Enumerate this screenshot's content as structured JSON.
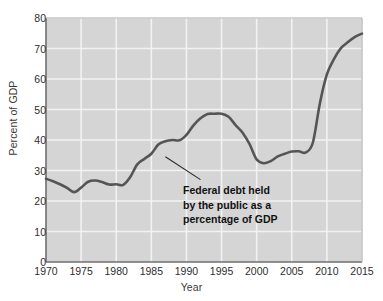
{
  "chart_data": {
    "type": "line",
    "title": "",
    "xlabel": "Year",
    "ylabel": "Percent of GDP",
    "xlim": [
      1970,
      2015
    ],
    "ylim": [
      0,
      80
    ],
    "grid": true,
    "legend": "none",
    "xticks": [
      "1970",
      "1975",
      "1980",
      "1985",
      "1990",
      "1995",
      "2000",
      "2005",
      "2010",
      "2015"
    ],
    "yticks": [
      "0",
      "10",
      "20",
      "30",
      "40",
      "50",
      "60",
      "70",
      "80"
    ],
    "line_color": "#555555",
    "plot_background": "#d5d5d5",
    "gridline_color": "#f2f2f2",
    "series": [
      {
        "name": "Federal debt held by the public as a percentage of GDP",
        "x": [
          1970,
          1971,
          1972,
          1973,
          1974,
          1975,
          1976,
          1977,
          1978,
          1979,
          1980,
          1981,
          1982,
          1983,
          1984,
          1985,
          1986,
          1987,
          1988,
          1989,
          1990,
          1991,
          1992,
          1993,
          1994,
          1995,
          1996,
          1997,
          1998,
          1999,
          2000,
          2001,
          2002,
          2003,
          2004,
          2005,
          2006,
          2007,
          2008,
          2009,
          2010,
          2011,
          2012,
          2013,
          2014,
          2015
        ],
        "values": [
          27.3,
          26.5,
          25.5,
          24.3,
          22.9,
          24.4,
          26.3,
          26.7,
          26.2,
          25.4,
          25.5,
          25.3,
          27.9,
          32.0,
          33.8,
          35.5,
          38.5,
          39.6,
          40.0,
          39.9,
          41.7,
          44.8,
          47.1,
          48.5,
          48.6,
          48.6,
          47.6,
          44.9,
          42.4,
          38.6,
          33.6,
          32.4,
          33.1,
          34.6,
          35.5,
          36.2,
          36.3,
          35.9,
          39.1,
          52.0,
          61.5,
          66.5,
          70.1,
          72.1,
          73.8,
          74.9
        ]
      }
    ],
    "annotations": [
      {
        "name": "series-callout",
        "lines": [
          "Federal debt held",
          "by the public as a",
          "percentage of GDP"
        ],
        "leader_from": [
          1987,
          34.5
        ],
        "leader_to": [
          1992,
          27.0
        ]
      }
    ]
  }
}
